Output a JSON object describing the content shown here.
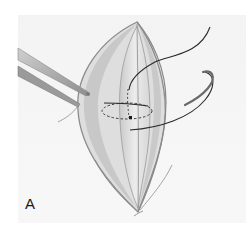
{
  "figure": {
    "label": "A",
    "elements": [
      "forceps-icon",
      "wound-edge",
      "suture-needle-icon",
      "suture-thread",
      "buried-stitch-path"
    ],
    "colors": {
      "background": "#ffffff",
      "panel": "#f4f4f4",
      "tissue_edge": "#9a9a9a",
      "tissue_fill": "#d8d8d8",
      "inner_fold": "#e6e6e6",
      "suture": "#2a2a2a",
      "forceps": "#a8a8a8"
    }
  }
}
